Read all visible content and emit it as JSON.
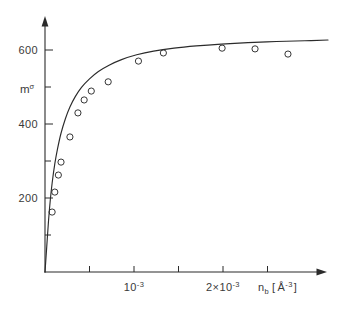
{
  "figure": {
    "background_color": "#ffffff",
    "ink_color": "#2b2b2b",
    "text_color": "#3a3a3a"
  },
  "axes": {
    "y_label_base": "m",
    "y_label_superscript": "σ",
    "y_tick_labels": [
      "200",
      "400",
      "600"
    ],
    "x_tick_label_1_base": "10",
    "x_tick_label_1_exponent": "-3",
    "x_tick_label_2_prefix": "2×",
    "x_tick_label_2_base": "10",
    "x_tick_label_2_exponent": "-3",
    "x_title_base": "n",
    "x_title_subscript": "b",
    "x_title_bracket_open": "[",
    "x_title_unit": "Å",
    "x_title_unit_exponent": "-3",
    "x_title_bracket_close": "]"
  },
  "chart_data": {
    "type": "scatter",
    "title": "",
    "subtitle": "",
    "xlabel": "n_b [ Å^-3 ]",
    "ylabel": "m^σ",
    "xlim": [
      0,
      0.0033
    ],
    "ylim": [
      0,
      735
    ],
    "grid": false,
    "legend": null,
    "x_tick_values": [
      0.0005,
      0.001,
      0.0015,
      0.002,
      0.0025
    ],
    "x_labeled_ticks": [
      {
        "value": 0.001,
        "label": "10^-3"
      },
      {
        "value": 0.002,
        "label": "2×10^-3"
      }
    ],
    "y_tick_values": [
      100,
      200,
      300,
      400,
      500,
      600,
      700
    ],
    "y_labeled_ticks": [
      {
        "value": 200,
        "label": "200"
      },
      {
        "value": 400,
        "label": "400"
      },
      {
        "value": 600,
        "label": "600"
      }
    ],
    "axis_arrows": {
      "x": true,
      "y": true
    },
    "series": [
      {
        "name": "measured points",
        "marker": "open-circle",
        "x": [
          8e-05,
          0.00011,
          0.00015,
          0.00018,
          0.00028,
          0.00037,
          0.00044,
          0.00052,
          0.00071,
          0.00105,
          0.00133,
          0.00199,
          0.00236,
          0.00273
        ],
        "y": [
          162,
          216,
          262,
          297,
          365,
          430,
          465,
          489,
          514,
          570,
          592,
          605,
          603,
          589
        ]
      },
      {
        "name": "fit curve",
        "marker": "none",
        "style": "solid-line",
        "x": [
          0.0,
          2e-05,
          4e-05,
          6e-05,
          8e-05,
          0.00011,
          0.00014,
          0.00018,
          0.00023,
          0.00028,
          0.00034,
          0.00041,
          0.0005,
          0.0006,
          0.00072,
          0.00086,
          0.00103,
          0.00122,
          0.00145,
          0.0017,
          0.00198,
          0.00228,
          0.0026,
          0.00292,
          0.00318
        ],
        "y": [
          0,
          70,
          140,
          196,
          240,
          292,
          332,
          375,
          415,
          446,
          474,
          499,
          522,
          542,
          559,
          574,
          587,
          597,
          605,
          611,
          616,
          620,
          623,
          625,
          627
        ]
      }
    ]
  }
}
